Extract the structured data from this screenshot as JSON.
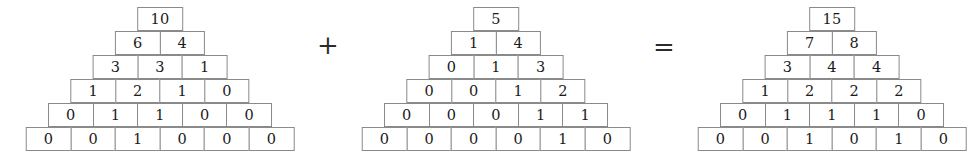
{
  "figure": {
    "kind": "number-pyramid-addition",
    "rows_per_pyramid": 6,
    "base_cells": 6,
    "colors": {
      "background": "#ffffff",
      "cell_border": "#8a8a8a",
      "text": "#1a1a1a",
      "operator": "#2b2b2b"
    }
  },
  "operators": {
    "plus": "+",
    "equals": "="
  },
  "pyramids": [
    {
      "name": "first-addend",
      "apex": "10",
      "rows": [
        [
          "10"
        ],
        [
          "6",
          "4"
        ],
        [
          "3",
          "3",
          "1"
        ],
        [
          "1",
          "2",
          "1",
          "0"
        ],
        [
          "0",
          "1",
          "1",
          "0",
          "0"
        ],
        [
          "0",
          "0",
          "1",
          "0",
          "0",
          "0"
        ]
      ]
    },
    {
      "name": "second-addend",
      "apex": "5",
      "rows": [
        [
          "5"
        ],
        [
          "1",
          "4"
        ],
        [
          "0",
          "1",
          "3"
        ],
        [
          "0",
          "0",
          "1",
          "2"
        ],
        [
          "0",
          "0",
          "0",
          "1",
          "1"
        ],
        [
          "0",
          "0",
          "0",
          "0",
          "1",
          "0"
        ]
      ]
    },
    {
      "name": "sum-result",
      "apex": "15",
      "rows": [
        [
          "15"
        ],
        [
          "7",
          "8"
        ],
        [
          "3",
          "4",
          "4"
        ],
        [
          "1",
          "2",
          "2",
          "2"
        ],
        [
          "0",
          "1",
          "1",
          "1",
          "0"
        ],
        [
          "0",
          "0",
          "1",
          "0",
          "1",
          "0"
        ]
      ]
    }
  ]
}
